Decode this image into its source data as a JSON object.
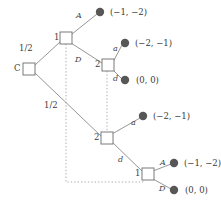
{
  "figure": {
    "type": "extensive-form-game-tree",
    "background_color": "#ffffff",
    "line_color": "#8a8a8a",
    "node_fill": "#ffffff",
    "node_stroke": "#7a7a7a",
    "terminal_color": "#575757",
    "text_color": "#3f3f3f",
    "dotted_color": "#9a9a9a"
  },
  "nodes": {
    "chance": {
      "id": "C",
      "label": "C",
      "x": 29,
      "y": 69,
      "kind": "square"
    },
    "p1_top": {
      "id": "1-top",
      "label": "1",
      "x": 66,
      "y": 38,
      "kind": "square"
    },
    "p2_top": {
      "id": "2-top",
      "label": "2",
      "x": 108,
      "y": 65,
      "kind": "square"
    },
    "p2_bottom": {
      "id": "2-bottom",
      "label": "2",
      "x": 107,
      "y": 138,
      "kind": "square"
    },
    "p1_bottom": {
      "id": "1-bottom",
      "label": "1",
      "x": 148,
      "y": 174,
      "kind": "square"
    }
  },
  "node_labels": {
    "chance": "C",
    "p1_top": "1",
    "p2_top": "2",
    "p2_bottom": "2",
    "p1_bottom": "1"
  },
  "probabilities": {
    "upper_branch": "1/2",
    "lower_branch": "1/2"
  },
  "actions": {
    "p1_top_A": "A",
    "p1_top_D": "D",
    "p2_top_a": "a",
    "p2_top_d": "d",
    "p2_bottom_a": "a",
    "p2_bottom_d": "d",
    "p1_bottom_A": "A",
    "p1_bottom_D": "D"
  },
  "terminals": [
    {
      "id": "t1",
      "payoff": "(−1, −2)",
      "dot_x": 100,
      "dot_y": 12,
      "text_x": 110,
      "text_y": 9,
      "from": "p1_top",
      "action": "A"
    },
    {
      "id": "t2",
      "payoff": "(−2, −1)",
      "dot_x": 125,
      "dot_y": 43,
      "text_x": 135,
      "text_y": 40,
      "from": "p2_top",
      "action": "a"
    },
    {
      "id": "t3",
      "payoff": "(0, 0)",
      "dot_x": 125,
      "dot_y": 80,
      "text_x": 136,
      "text_y": 77,
      "from": "p2_top",
      "action": "d"
    },
    {
      "id": "t4",
      "payoff": "(−2, −1)",
      "dot_x": 143,
      "dot_y": 116,
      "text_x": 153,
      "text_y": 113,
      "from": "p2_bottom",
      "action": "a"
    },
    {
      "id": "t5",
      "payoff": "(−1, −2)",
      "dot_x": 174,
      "dot_y": 163,
      "text_x": 184,
      "text_y": 160,
      "from": "p1_bottom",
      "action": "A"
    },
    {
      "id": "t6",
      "payoff": "(0, 0)",
      "dot_x": 174,
      "dot_y": 190,
      "text_x": 185,
      "text_y": 187,
      "from": "p1_bottom",
      "action": "D"
    }
  ],
  "information_sets": [
    {
      "id": "iset-player1",
      "members": [
        "p1_top",
        "p1_bottom"
      ],
      "style": "dotted"
    },
    {
      "id": "iset-player2",
      "members": [
        "p2_top",
        "p2_bottom"
      ],
      "style": "dotted"
    }
  ],
  "label_positions": {
    "chance_label": {
      "x": 15,
      "y": 64
    },
    "p1_top_label": {
      "x": 55,
      "y": 33
    },
    "p2_top_label": {
      "x": 96,
      "y": 61
    },
    "p2_bottom_label": {
      "x": 95,
      "y": 134
    },
    "p1_bottom_label": {
      "x": 136,
      "y": 170
    },
    "prob_upper": {
      "x": 20,
      "y": 45
    },
    "prob_lower": {
      "x": 44,
      "y": 102
    },
    "act_A_top": {
      "x": 76,
      "y": 13
    },
    "act_D_top": {
      "x": 76,
      "y": 57
    },
    "act_a_top": {
      "x": 113,
      "y": 46
    },
    "act_d_top": {
      "x": 113,
      "y": 76
    },
    "act_a_bottom": {
      "x": 131,
      "y": 120
    },
    "act_d_bottom": {
      "x": 118,
      "y": 157
    },
    "act_A_bottom": {
      "x": 160,
      "y": 160
    },
    "act_D_bottom": {
      "x": 160,
      "y": 186
    }
  }
}
